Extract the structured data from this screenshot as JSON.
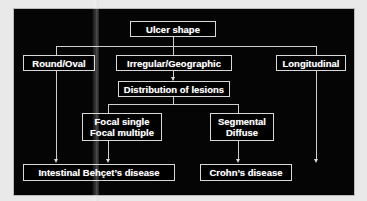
{
  "diagram": {
    "background_color": "#050505",
    "line_color": "#cfcfcf",
    "text_color": "#ffffff",
    "nodes": [
      {
        "id": "ulcer_shape",
        "label": "Ulcer shape",
        "lines": [
          "Ulcer shape"
        ]
      },
      {
        "id": "round_oval",
        "label": "Round/Oval",
        "lines": [
          "Round/Oval"
        ]
      },
      {
        "id": "irregular",
        "label": "Irregular/Geographic",
        "lines": [
          "Irregular/Geographic"
        ]
      },
      {
        "id": "longitudinal",
        "label": "Longitudinal",
        "lines": [
          "Longitudinal"
        ]
      },
      {
        "id": "distribution",
        "label": "Distribution of lesions",
        "lines": [
          "Distribution of lesions"
        ]
      },
      {
        "id": "focal",
        "label": "Focal single / Focal multiple",
        "lines": [
          "Focal single",
          "Focal multiple"
        ]
      },
      {
        "id": "segmental",
        "label": "Segmental / Diffuse",
        "lines": [
          "Segmental",
          "Diffuse"
        ]
      },
      {
        "id": "behcet",
        "label": "Intestinal Behçet’s disease",
        "lines": [
          "Intestinal Behçet’s disease"
        ]
      },
      {
        "id": "crohn",
        "label": "Crohn’s disease",
        "lines": [
          "Crohn’s disease"
        ]
      }
    ],
    "edges": [
      {
        "from": "ulcer_shape",
        "to": "round_oval"
      },
      {
        "from": "ulcer_shape",
        "to": "irregular"
      },
      {
        "from": "ulcer_shape",
        "to": "longitudinal"
      },
      {
        "from": "round_oval",
        "to": "behcet"
      },
      {
        "from": "irregular",
        "to": "distribution"
      },
      {
        "from": "longitudinal",
        "to": "crohn"
      },
      {
        "from": "distribution",
        "to": "behcet"
      },
      {
        "from": "distribution",
        "to": "crohn"
      }
    ]
  }
}
